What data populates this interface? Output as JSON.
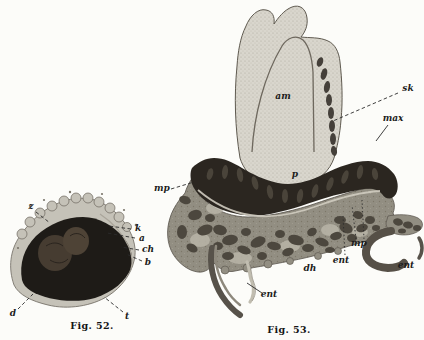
{
  "document": {
    "type": "historical anatomical plate, embryo sections",
    "background": "#fcfcf9",
    "colors": {
      "ink": "#1c1c1c",
      "fig52_crust": "#c5c2b8",
      "fig52_dark_mass": "#1e1b17",
      "fig53_stippled_mass": "#d9d6cd",
      "fig53_dark_band": "#2b2620",
      "fig53_cell_tissue": "#928e82"
    },
    "figures": [
      {
        "id": "fig52",
        "caption": "Fig. 52.",
        "labels": [
          {
            "text": "z",
            "x": 31,
            "y": 209,
            "leaders": [
              {
                "x1": 36,
                "y1": 212,
                "x2": 50,
                "y2": 223,
                "style": "dashed"
              }
            ]
          },
          {
            "text": "k",
            "x": 138,
            "y": 231,
            "leaders": [
              {
                "x1": 131,
                "y1": 229,
                "x2": 109,
                "y2": 226,
                "style": "dashed"
              }
            ]
          },
          {
            "text": "a",
            "x": 142,
            "y": 241,
            "leaders": [
              {
                "x1": 135,
                "y1": 238,
                "x2": 107,
                "y2": 233,
                "style": "dashed"
              }
            ]
          },
          {
            "text": "ch",
            "x": 148,
            "y": 252,
            "leaders": [
              {
                "x1": 139,
                "y1": 250,
                "x2": 121,
                "y2": 247,
                "style": "dashed"
              }
            ]
          },
          {
            "text": "b",
            "x": 148,
            "y": 265,
            "leaders": [
              {
                "x1": 142,
                "y1": 261,
                "x2": 126,
                "y2": 254,
                "style": "dashed"
              }
            ]
          },
          {
            "text": "d",
            "x": 13,
            "y": 316,
            "leaders": [
              {
                "x1": 18,
                "y1": 309,
                "x2": 33,
                "y2": 294,
                "style": "dashed"
              }
            ]
          },
          {
            "text": "t",
            "x": 127,
            "y": 319,
            "leaders": [
              {
                "x1": 123,
                "y1": 312,
                "x2": 104,
                "y2": 297,
                "style": "dashed"
              }
            ]
          }
        ]
      },
      {
        "id": "fig53",
        "caption": "Fig. 53.",
        "labels": [
          {
            "text": "am",
            "x": 283,
            "y": 99
          },
          {
            "text": "sk",
            "x": 408,
            "y": 91,
            "leaders": [
              {
                "x1": 398,
                "y1": 93,
                "x2": 333,
                "y2": 121,
                "style": "dashed"
              }
            ]
          },
          {
            "text": "max",
            "x": 393,
            "y": 121,
            "leaders": [
              {
                "x1": 388,
                "y1": 125,
                "x2": 376,
                "y2": 141,
                "style": "solid"
              }
            ]
          },
          {
            "text": "p",
            "x": 295,
            "y": 177
          },
          {
            "text": "mp",
            "x": 162,
            "y": 191,
            "leaders": [
              {
                "x1": 171,
                "y1": 189,
                "x2": 194,
                "y2": 182,
                "style": "dashed"
              }
            ]
          },
          {
            "text": "mp",
            "x": 359,
            "y": 246,
            "leaders": [
              {
                "x1": 356,
                "y1": 239,
                "x2": 352,
                "y2": 205,
                "style": "dotted"
              },
              {
                "x1": 364,
                "y1": 239,
                "x2": 362,
                "y2": 200,
                "style": "dotted"
              }
            ]
          },
          {
            "text": "ent",
            "x": 341,
            "y": 263,
            "leaders": [
              {
                "x1": 345,
                "y1": 255,
                "x2": 343,
                "y2": 216,
                "style": "dotted"
              }
            ]
          },
          {
            "text": "ent",
            "x": 406,
            "y": 268
          },
          {
            "text": "dh",
            "x": 310,
            "y": 271
          },
          {
            "text": "ent",
            "x": 269,
            "y": 297,
            "leaders": [
              {
                "x1": 262,
                "y1": 293,
                "x2": 247,
                "y2": 283,
                "style": "solid"
              }
            ]
          }
        ]
      }
    ]
  }
}
